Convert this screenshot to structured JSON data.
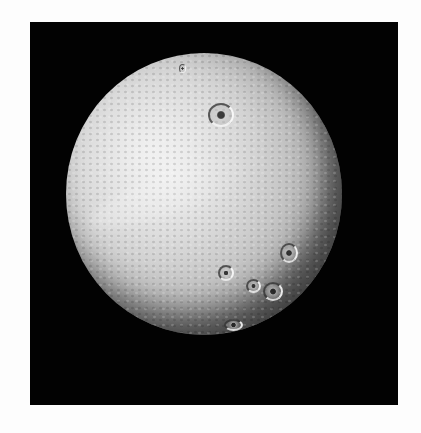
{
  "image": {
    "subject": "cratered-moon",
    "background_color": "#fdfdfd",
    "frame_color": "#020202",
    "moon_highlight_color": "#e6e6e6",
    "moon_shadow_color": "#1a1a1a"
  }
}
